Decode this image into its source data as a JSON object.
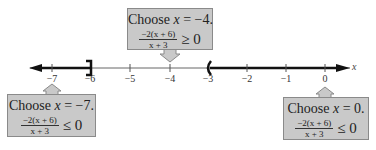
{
  "number_line": {
    "axis_label": "x",
    "ticks": [
      {
        "value": -7,
        "label": "−7",
        "x": 52
      },
      {
        "value": -6,
        "label": "−6",
        "x": 90
      },
      {
        "value": -5,
        "label": "−5",
        "x": 130
      },
      {
        "value": -4,
        "label": "−4",
        "x": 170
      },
      {
        "value": -3,
        "label": "−3",
        "x": 208
      },
      {
        "value": -2,
        "label": "−2",
        "x": 247
      },
      {
        "value": -1,
        "label": "−1",
        "x": 286
      },
      {
        "value": 0,
        "label": "0",
        "x": 325
      }
    ],
    "solution_intervals": [
      {
        "from": "-infinity",
        "to": -6,
        "to_endpoint": "closed bracket ]"
      },
      {
        "from": -3,
        "to": "infinity",
        "from_endpoint": "open parenthesis ("
      }
    ]
  },
  "test_boxes": {
    "left": {
      "title_prefix": "Choose ",
      "variable": "x",
      "title_suffix": " = −7.",
      "numerator": "−2(x + 6)",
      "denominator": "x + 3",
      "relation": "≤  0"
    },
    "middle": {
      "title_prefix": "Choose ",
      "variable": "x",
      "title_suffix": " = −4.",
      "numerator": "−2(x + 6)",
      "denominator": "x + 3",
      "relation": "≥  0"
    },
    "right": {
      "title_prefix": "Choose ",
      "variable": "x",
      "title_suffix": " = 0.",
      "numerator": "−2(x + 6)",
      "denominator": "x + 3",
      "relation": "≤  0"
    }
  },
  "colors": {
    "box_fill": "#c9c9c9",
    "box_border": "#8a8a8a",
    "axis_thin": "#555555",
    "axis_bold": "#111111"
  }
}
